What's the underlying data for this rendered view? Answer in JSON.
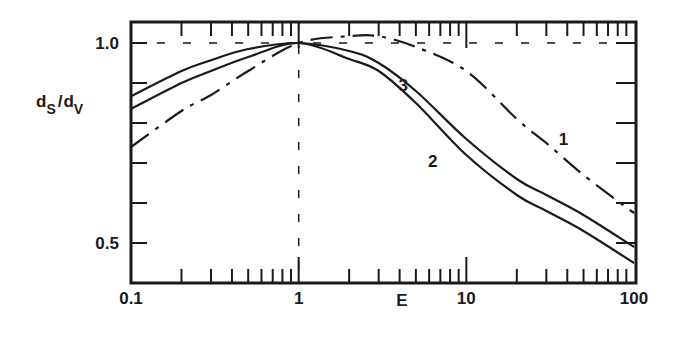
{
  "chart_data": {
    "type": "line",
    "title": "",
    "xlabel": "E",
    "ylabel": "d_S/d_V",
    "ylabel_main": "d",
    "ylabel_sub1": "S",
    "ylabel_sep": "/",
    "ylabel_sub2": "V",
    "xscale": "log",
    "xlim": [
      0.1,
      100
    ],
    "ylim": [
      0.4,
      1.05
    ],
    "x_ticks": [
      {
        "value": 0.1,
        "label": "0.1"
      },
      {
        "value": 1,
        "label": "1"
      },
      {
        "value": 10,
        "label": "10"
      },
      {
        "value": 100,
        "label": "100"
      }
    ],
    "y_ticks": [
      {
        "value": 1.0,
        "label": "1.0"
      },
      {
        "value": 0.9,
        "label": ""
      },
      {
        "value": 0.8,
        "label": ""
      },
      {
        "value": 0.7,
        "label": ""
      },
      {
        "value": 0.6,
        "label": ""
      },
      {
        "value": 0.5,
        "label": "0.5"
      }
    ],
    "reference_lines": [
      {
        "type": "horizontal",
        "y": 1.0,
        "style": "dashed"
      },
      {
        "type": "vertical",
        "x": 1,
        "style": "dashed"
      }
    ],
    "grid": false,
    "legend": "none (curves labelled inline)",
    "series": [
      {
        "name": "1",
        "style": "dash-dot",
        "x": [
          0.1,
          0.2,
          0.3,
          0.5,
          1,
          2,
          3,
          5,
          10,
          20,
          30,
          50,
          100
        ],
        "y": [
          0.74,
          0.83,
          0.87,
          0.93,
          1.0,
          1.017,
          1.017,
          0.99,
          0.93,
          0.81,
          0.75,
          0.67,
          0.575
        ]
      },
      {
        "name": "2",
        "style": "solid",
        "x": [
          0.1,
          0.2,
          0.3,
          0.5,
          1,
          2,
          3,
          5,
          10,
          20,
          30,
          50,
          100
        ],
        "y": [
          0.835,
          0.9,
          0.93,
          0.965,
          1.0,
          0.96,
          0.93,
          0.85,
          0.72,
          0.62,
          0.58,
          0.53,
          0.45
        ]
      },
      {
        "name": "3",
        "style": "solid",
        "x": [
          0.1,
          0.2,
          0.3,
          0.5,
          1,
          2,
          3,
          5,
          10,
          20,
          30,
          50,
          100
        ],
        "y": [
          0.867,
          0.93,
          0.957,
          0.985,
          1.0,
          0.98,
          0.95,
          0.88,
          0.76,
          0.66,
          0.62,
          0.57,
          0.49
        ]
      }
    ],
    "annotations": [
      {
        "text": "1",
        "x": 38,
        "y": 0.745
      },
      {
        "text": "2",
        "x": 6.3,
        "y": 0.69
      },
      {
        "text": "3",
        "x": 4.2,
        "y": 0.88
      }
    ]
  }
}
